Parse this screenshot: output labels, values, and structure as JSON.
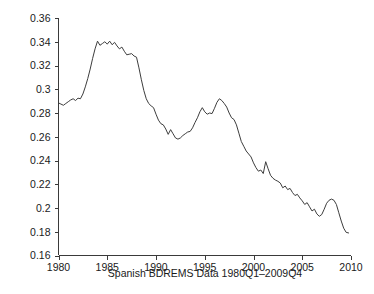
{
  "chart_data": {
    "type": "line",
    "title": "",
    "xlabel": "Spanish BDREMS Data 1980Q1–2009Q4",
    "ylabel": "",
    "xlim": [
      1980,
      2010
    ],
    "ylim": [
      0.16,
      0.36
    ],
    "grid": false,
    "legend": null,
    "xticks": [
      1980,
      1985,
      1990,
      1995,
      2000,
      2005,
      2010
    ],
    "xticklabels": [
      "1980",
      "1985",
      "1990",
      "1995",
      "2000",
      "2005",
      "2010"
    ],
    "yticks": [
      0.16,
      0.18,
      0.2,
      0.22,
      0.24,
      0.26,
      0.28,
      0.3,
      0.32,
      0.34,
      0.36
    ],
    "yticklabels": [
      "0.16",
      "0.18",
      "0.2",
      "0.22",
      "0.24",
      "0.26",
      "0.28",
      "0.3",
      "0.32",
      "0.34",
      "0.36"
    ],
    "line_color": "#3d3d3d",
    "series": [
      {
        "name": "Spanish BDREMS ratio",
        "x": [
          1980.0,
          1980.25,
          1980.5,
          1980.75,
          1981.0,
          1981.25,
          1981.5,
          1981.75,
          1982.0,
          1982.25,
          1982.5,
          1982.75,
          1983.0,
          1983.25,
          1983.5,
          1983.75,
          1984.0,
          1984.25,
          1984.5,
          1984.75,
          1985.0,
          1985.25,
          1985.5,
          1985.75,
          1986.0,
          1986.25,
          1986.5,
          1986.75,
          1987.0,
          1987.25,
          1987.5,
          1987.75,
          1988.0,
          1988.25,
          1988.5,
          1988.75,
          1989.0,
          1989.25,
          1989.5,
          1989.75,
          1990.0,
          1990.25,
          1990.5,
          1990.75,
          1991.0,
          1991.25,
          1991.5,
          1991.75,
          1992.0,
          1992.25,
          1992.5,
          1992.75,
          1993.0,
          1993.25,
          1993.5,
          1993.75,
          1994.0,
          1994.25,
          1994.5,
          1994.75,
          1995.0,
          1995.25,
          1995.5,
          1995.75,
          1996.0,
          1996.25,
          1996.5,
          1996.75,
          1997.0,
          1997.25,
          1997.5,
          1997.75,
          1998.0,
          1998.25,
          1998.5,
          1998.75,
          1999.0,
          1999.25,
          1999.5,
          1999.75,
          2000.0,
          2000.25,
          2000.5,
          2000.75,
          2001.0,
          2001.25,
          2001.5,
          2001.75,
          2002.0,
          2002.25,
          2002.5,
          2002.75,
          2003.0,
          2003.25,
          2003.5,
          2003.75,
          2004.0,
          2004.25,
          2004.5,
          2004.75,
          2005.0,
          2005.25,
          2005.5,
          2005.75,
          2006.0,
          2006.25,
          2006.5,
          2006.75,
          2007.0,
          2007.25,
          2007.5,
          2007.75,
          2008.0,
          2008.25,
          2008.5,
          2008.75,
          2009.0,
          2009.25,
          2009.5,
          2009.75
        ],
        "y": [
          0.2885,
          0.2875,
          0.2865,
          0.288,
          0.2895,
          0.291,
          0.292,
          0.2905,
          0.2925,
          0.292,
          0.296,
          0.302,
          0.309,
          0.317,
          0.326,
          0.334,
          0.3405,
          0.337,
          0.3385,
          0.34,
          0.338,
          0.3405,
          0.3375,
          0.3395,
          0.3365,
          0.334,
          0.3355,
          0.332,
          0.329,
          0.3295,
          0.33,
          0.328,
          0.327,
          0.318,
          0.308,
          0.299,
          0.292,
          0.288,
          0.286,
          0.2845,
          0.279,
          0.274,
          0.271,
          0.27,
          0.2665,
          0.262,
          0.266,
          0.2625,
          0.259,
          0.258,
          0.259,
          0.261,
          0.2625,
          0.264,
          0.2645,
          0.2675,
          0.272,
          0.276,
          0.281,
          0.2845,
          0.281,
          0.279,
          0.28,
          0.2795,
          0.284,
          0.289,
          0.292,
          0.2905,
          0.288,
          0.285,
          0.28,
          0.276,
          0.2745,
          0.27,
          0.263,
          0.256,
          0.252,
          0.248,
          0.2455,
          0.243,
          0.238,
          0.234,
          0.231,
          0.232,
          0.229,
          0.239,
          0.233,
          0.2275,
          0.225,
          0.2235,
          0.2225,
          0.221,
          0.217,
          0.2185,
          0.2155,
          0.2165,
          0.213,
          0.2105,
          0.2115,
          0.2085,
          0.206,
          0.203,
          0.2045,
          0.201,
          0.1975,
          0.199,
          0.195,
          0.193,
          0.1945,
          0.199,
          0.204,
          0.2065,
          0.2075,
          0.2065,
          0.203,
          0.196,
          0.189,
          0.183,
          0.1795,
          0.179
        ]
      }
    ]
  },
  "axes": {
    "x_axis_name": "year-axis",
    "y_axis_name": "ratio-axis"
  }
}
